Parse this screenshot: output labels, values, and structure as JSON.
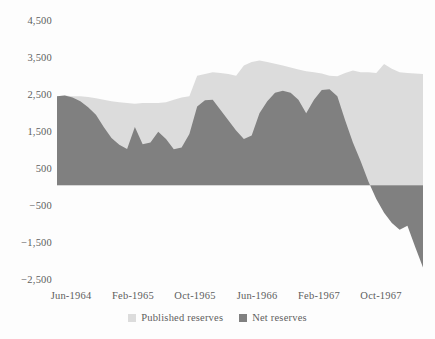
{
  "chart_data": {
    "type": "area",
    "title": "",
    "subtitle": "",
    "xlabel": "",
    "ylabel": "",
    "ylim": [
      -3000,
      5000
    ],
    "grid": false,
    "legend_position": "bottom",
    "stacked": false,
    "y_ticks": [
      "4,500",
      "3,500",
      "2,500",
      "1,500",
      "500",
      "−500",
      "−1,500",
      "−2,500"
    ],
    "y_tick_values": [
      4500,
      3500,
      2500,
      1500,
      500,
      -500,
      -1500,
      -2500
    ],
    "x_ticks": [
      "Jun-1964",
      "Feb-1965",
      "Oct-1965",
      "Jun-1966",
      "Feb-1967",
      "Oct-1967"
    ],
    "x_tick_values": [
      0,
      8,
      16,
      24,
      32,
      40
    ],
    "x": [
      0,
      1,
      2,
      3,
      4,
      5,
      6,
      7,
      8,
      9,
      10,
      11,
      12,
      13,
      14,
      15,
      16,
      17,
      18,
      19,
      20,
      21,
      22,
      23,
      24,
      25,
      26,
      27,
      28,
      29,
      30,
      31,
      32,
      33,
      34,
      35,
      36,
      37,
      38,
      39,
      40,
      41,
      42,
      43,
      44,
      45,
      46,
      47
    ],
    "series": [
      {
        "name": "Published reserves",
        "color": "#dcdcdc",
        "values": [
          2600,
          2620,
          2600,
          2600,
          2580,
          2540,
          2500,
          2450,
          2420,
          2400,
          2380,
          2400,
          2400,
          2400,
          2420,
          2500,
          2560,
          2600,
          3200,
          3250,
          3300,
          3280,
          3250,
          3200,
          3500,
          3600,
          3640,
          3600,
          3550,
          3500,
          3440,
          3380,
          3330,
          3300,
          3260,
          3200,
          3180,
          3280,
          3350,
          3300,
          3300,
          3280,
          3540,
          3400,
          3300,
          3280,
          3260,
          3250
        ]
      },
      {
        "name": "Net reserves",
        "color": "#808080",
        "values": [
          2600,
          2620,
          2560,
          2450,
          2280,
          2060,
          1700,
          1380,
          1180,
          1060,
          1700,
          1200,
          1250,
          1560,
          1350,
          1050,
          1100,
          1500,
          2300,
          2480,
          2500,
          2200,
          1900,
          1600,
          1350,
          1450,
          2100,
          2450,
          2700,
          2760,
          2700,
          2500,
          2100,
          2500,
          2780,
          2800,
          2600,
          1900,
          1250,
          700,
          100,
          -400,
          -800,
          -1100,
          -1300,
          -1180,
          -1800,
          -2400
        ]
      }
    ]
  },
  "legend": {
    "items": [
      {
        "label": "Published reserves",
        "color": "#dcdcdc"
      },
      {
        "label": "Net reserves",
        "color": "#808080"
      }
    ]
  }
}
